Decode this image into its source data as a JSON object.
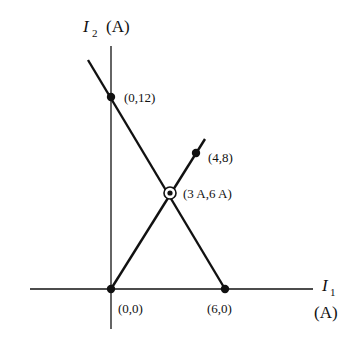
{
  "diagram": {
    "y_axis_label": {
      "symbol": "I",
      "subscript": "2",
      "unit": "(A)"
    },
    "x_axis_label": {
      "symbol": "I",
      "subscript": "1",
      "unit": "(A)"
    },
    "points": [
      {
        "id": "p0012",
        "label": "(0,12)",
        "x": 0,
        "y": 12,
        "marker": "filled"
      },
      {
        "id": "p48",
        "label": "(4,8)",
        "x": 4,
        "y": 8,
        "marker": "filled"
      },
      {
        "id": "p36",
        "label": "(3 A,6 A)",
        "x": 3,
        "y": 6,
        "marker": "circled"
      },
      {
        "id": "p00",
        "label": "(0,0)",
        "x": 0,
        "y": 0,
        "marker": "filled"
      },
      {
        "id": "p60",
        "label": "(6,0)",
        "x": 6,
        "y": 0,
        "marker": "filled"
      }
    ],
    "lines": [
      {
        "name": "line-through-0-12-and-6-0",
        "from": [
          0,
          12
        ],
        "to": [
          6,
          0
        ]
      },
      {
        "name": "line-through-0-0-and-4-8",
        "from": [
          0,
          0
        ],
        "to": [
          4,
          8
        ]
      }
    ],
    "stroke_color": "#111111"
  }
}
